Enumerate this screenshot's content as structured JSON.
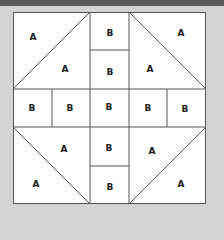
{
  "diagram": {
    "colors": {
      "background": "#d4d4d4",
      "block": "#ffffff",
      "line": "#555555",
      "topbar": "#5a5a5a"
    },
    "labels": [
      {
        "text": "A",
        "x": 33,
        "y": 37
      },
      {
        "text": "A",
        "x": 65,
        "y": 69
      },
      {
        "text": "B",
        "x": 110,
        "y": 33
      },
      {
        "text": "B",
        "x": 110,
        "y": 72
      },
      {
        "text": "A",
        "x": 181,
        "y": 33
      },
      {
        "text": "A",
        "x": 150,
        "y": 69
      },
      {
        "text": "B",
        "x": 32,
        "y": 108
      },
      {
        "text": "B",
        "x": 70,
        "y": 108
      },
      {
        "text": "B",
        "x": 109,
        "y": 107
      },
      {
        "text": "B",
        "x": 148,
        "y": 108
      },
      {
        "text": "B",
        "x": 185,
        "y": 109
      },
      {
        "text": "A",
        "x": 64,
        "y": 149
      },
      {
        "text": "B",
        "x": 109,
        "y": 148
      },
      {
        "text": "A",
        "x": 152,
        "y": 151
      },
      {
        "text": "A",
        "x": 36,
        "y": 184
      },
      {
        "text": "B",
        "x": 110,
        "y": 187
      },
      {
        "text": "A",
        "x": 181,
        "y": 184
      }
    ]
  }
}
